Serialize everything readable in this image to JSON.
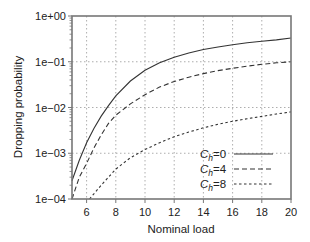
{
  "chart_data": {
    "type": "line",
    "title": "",
    "xlabel": "Nominal load",
    "ylabel": "Dropping probability",
    "xlim": [
      5,
      20
    ],
    "ylim": [
      0.0001,
      1
    ],
    "yscale": "log",
    "grid": true,
    "legend_position": "lower right",
    "x_ticks": [
      6,
      8,
      10,
      12,
      14,
      16,
      18,
      20
    ],
    "y_ticks": [
      {
        "value": 1,
        "label": "1e+00"
      },
      {
        "value": 0.1,
        "label": "1e−01"
      },
      {
        "value": 0.01,
        "label": "1e−02"
      },
      {
        "value": 0.001,
        "label": "1e−03"
      },
      {
        "value": 0.0001,
        "label": "1e−04"
      }
    ],
    "series": [
      {
        "name": "C_h=0",
        "legend_main": "C",
        "legend_sub": "h",
        "legend_value": "=0",
        "style": "solid",
        "x": [
          5,
          5.5,
          6,
          6.5,
          7,
          7.5,
          8,
          9,
          10,
          11,
          12,
          13,
          14,
          15,
          16,
          17,
          18,
          19,
          20
        ],
        "y": [
          0.00025,
          0.0007,
          0.0017,
          0.0035,
          0.0065,
          0.011,
          0.018,
          0.038,
          0.065,
          0.095,
          0.125,
          0.155,
          0.185,
          0.21,
          0.235,
          0.26,
          0.28,
          0.3,
          0.33
        ]
      },
      {
        "name": "C_h=4",
        "legend_main": "C",
        "legend_sub": "h",
        "legend_value": "=4",
        "style": "dashed",
        "x": [
          5,
          5.5,
          6,
          6.5,
          7,
          7.5,
          8,
          9,
          10,
          11,
          12,
          13,
          14,
          15,
          16,
          17,
          18,
          19,
          20
        ],
        "y": [
          0.0001,
          0.0003,
          0.0006,
          0.0013,
          0.0025,
          0.0045,
          0.0068,
          0.012,
          0.019,
          0.028,
          0.037,
          0.046,
          0.055,
          0.064,
          0.072,
          0.08,
          0.088,
          0.095,
          0.1
        ]
      },
      {
        "name": "C_h=8",
        "legend_main": "C",
        "legend_sub": "h",
        "legend_value": "=8",
        "style": "dotted",
        "x": [
          6.2,
          7,
          8,
          9,
          10,
          11,
          12,
          13,
          14,
          15,
          16,
          17,
          18,
          19,
          20
        ],
        "y": [
          0.0001,
          0.0002,
          0.00045,
          0.0008,
          0.0012,
          0.0017,
          0.0023,
          0.0029,
          0.0036,
          0.0043,
          0.005,
          0.0057,
          0.0064,
          0.0072,
          0.008
        ]
      }
    ]
  },
  "colors": {
    "line": "#333333",
    "axis": "#777777",
    "grid": "#999999"
  }
}
